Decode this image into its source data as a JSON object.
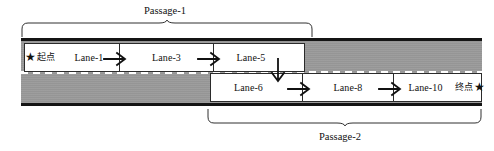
{
  "diagram": {
    "colors": {
      "road_fill": "#9a9a9a",
      "road_edge": "#141414",
      "lane_fill": "#ffffff",
      "lane_border": "#2b2b2b",
      "centerline": "#ffffff",
      "text": "#111111"
    },
    "passages": [
      {
        "id": "passage-1",
        "label": "Passage-1",
        "brace_side": "top"
      },
      {
        "id": "passage-2",
        "label": "Passage-2",
        "brace_side": "bottom"
      }
    ],
    "lanes_top": [
      {
        "id": "lane-1",
        "label": "Lane-1"
      },
      {
        "id": "lane-3",
        "label": "Lane-3"
      },
      {
        "id": "lane-5",
        "label": "Lane-5"
      }
    ],
    "lanes_bottom": [
      {
        "id": "lane-6",
        "label": "Lane-6"
      },
      {
        "id": "lane-8",
        "label": "Lane-8"
      },
      {
        "id": "lane-10",
        "label": "Lane-10"
      }
    ],
    "markers": {
      "start": {
        "star": "★",
        "label": "起点"
      },
      "end": {
        "star": "★",
        "label": "终点"
      }
    },
    "arrows": [
      {
        "id": "arrow-lane1-lane3",
        "direction": "right"
      },
      {
        "id": "arrow-lane3-lane5",
        "direction": "right"
      },
      {
        "id": "arrow-lane5-lane6",
        "direction": "down"
      },
      {
        "id": "arrow-lane6-lane8",
        "direction": "right"
      },
      {
        "id": "arrow-lane8-lane10",
        "direction": "right"
      }
    ]
  }
}
